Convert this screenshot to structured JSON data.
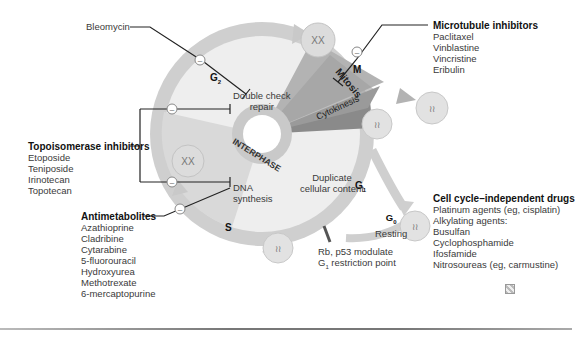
{
  "diagram": {
    "phases": {
      "g2": "G",
      "g2_sub": "2",
      "m": "M",
      "mitosis": "Mitosis",
      "cytokinesis": "Cytokinesis",
      "interphase": "INTERPHASE",
      "g1": "G",
      "g1_sub": "1",
      "s": "S",
      "g0": "G",
      "g0_sub": "0",
      "g0_label": "Resting"
    },
    "ring_labels": {
      "double_check": [
        "Double check",
        "repair"
      ],
      "dna_synthesis": [
        "DNA",
        "synthesis"
      ],
      "duplicate": [
        "Duplicate",
        "cellular content"
      ],
      "restriction": [
        "Rb, p53 modulate",
        "G",
        "1",
        " restriction point"
      ]
    },
    "drug_groups": {
      "bleomycin": {
        "header": "Bleomycin"
      },
      "topoisomerase": {
        "header": "Topoisomerase inhibitors",
        "items": [
          "Etoposide",
          "Teniposide",
          "Irinotecan",
          "Topotecan"
        ]
      },
      "antimetabolites": {
        "header": "Antimetabolites",
        "items": [
          "Azathioprine",
          "Cladribine",
          "Cytarabine",
          "5-fluorouracil",
          "Hydroxyurea",
          "Methotrexate",
          "6-mercaptopurine"
        ]
      },
      "microtubule": {
        "header": "Microtubule inhibitors",
        "items": [
          "Paclitaxel",
          "Vinblastine",
          "Vincristine",
          "Eribulin"
        ]
      },
      "independent": {
        "header": "Cell cycle–independent drugs",
        "items": [
          "Platinum agents (eg, cisplatin)",
          "Alkylating agents:"
        ],
        "sub_items": [
          "Busulfan",
          "Cyclophosphamide",
          "Ifosfamide",
          "Nitrosoureas (eg, carmustine)"
        ]
      }
    },
    "inhibit_symbol": "–",
    "colors": {
      "ring": "#c9c9c9",
      "inner": "#ececec",
      "s_wedge": "#d8d8d8",
      "mitosis": "#a8a8a8",
      "cytokinesis": "#8e8e8e",
      "cell": "#dcdcdc",
      "line": "#222222"
    }
  }
}
